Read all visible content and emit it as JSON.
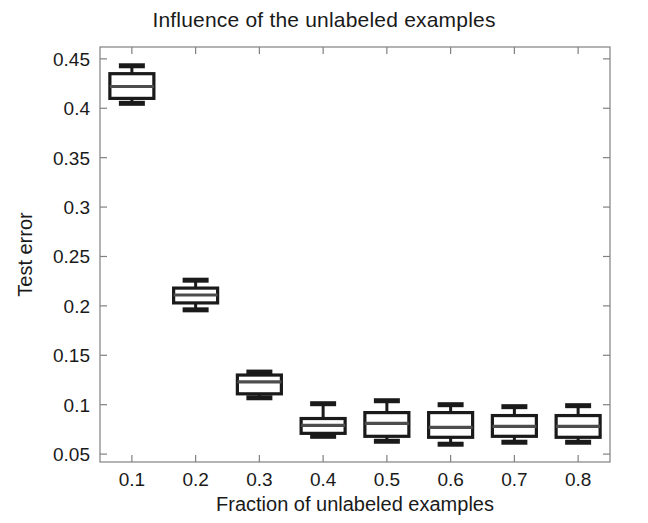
{
  "chart_data": {
    "type": "box",
    "title": "Influence of the unlabeled examples",
    "xlabel": "Fraction of unlabeled examples",
    "ylabel": "Test error",
    "grid": false,
    "legend": null,
    "xlim": [
      0.05,
      0.85
    ],
    "ylim": [
      0.042,
      0.462
    ],
    "yticks": [
      0.05,
      0.1,
      0.15,
      0.2,
      0.25,
      0.3,
      0.35,
      0.4,
      0.45
    ],
    "ytick_labels": [
      "0.05",
      "0.1",
      "0.15",
      "0.2",
      "0.25",
      "0.3",
      "0.35",
      "0.4",
      "0.45"
    ],
    "xticks": [
      0.1,
      0.2,
      0.3,
      0.4,
      0.5,
      0.6,
      0.7,
      0.8
    ],
    "xtick_labels": [
      "0.1",
      "0.2",
      "0.3",
      "0.4",
      "0.5",
      "0.6",
      "0.7",
      "0.8"
    ],
    "categories": [
      "0.1",
      "0.2",
      "0.3",
      "0.4",
      "0.5",
      "0.6",
      "0.7",
      "0.8"
    ],
    "boxes": [
      {
        "x": 0.1,
        "whisker_low": 0.405,
        "q1": 0.41,
        "median": 0.422,
        "q3": 0.435,
        "whisker_high": 0.443
      },
      {
        "x": 0.2,
        "whisker_low": 0.196,
        "q1": 0.203,
        "median": 0.211,
        "q3": 0.218,
        "whisker_high": 0.226
      },
      {
        "x": 0.3,
        "whisker_low": 0.107,
        "q1": 0.111,
        "median": 0.123,
        "q3": 0.13,
        "whisker_high": 0.133
      },
      {
        "x": 0.4,
        "whisker_low": 0.068,
        "q1": 0.071,
        "median": 0.079,
        "q3": 0.086,
        "whisker_high": 0.101
      },
      {
        "x": 0.5,
        "whisker_low": 0.063,
        "q1": 0.068,
        "median": 0.081,
        "q3": 0.092,
        "whisker_high": 0.104
      },
      {
        "x": 0.6,
        "whisker_low": 0.06,
        "q1": 0.067,
        "median": 0.077,
        "q3": 0.092,
        "whisker_high": 0.1
      },
      {
        "x": 0.7,
        "whisker_low": 0.062,
        "q1": 0.068,
        "median": 0.078,
        "q3": 0.089,
        "whisker_high": 0.098
      },
      {
        "x": 0.8,
        "whisker_low": 0.062,
        "q1": 0.067,
        "median": 0.078,
        "q3": 0.089,
        "whisker_high": 0.099
      }
    ],
    "style": {
      "line_color": "#1a1a1a",
      "median_color": "#4d4d4d",
      "box_fill": "#ffffff",
      "axis_color": "#808080",
      "background": "#ffffff"
    }
  }
}
